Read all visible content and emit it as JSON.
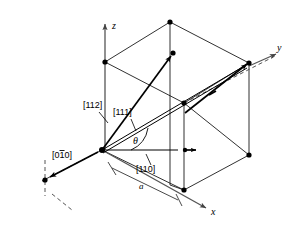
{
  "figure": {
    "axes": {
      "z": "z",
      "y": "y",
      "x": "x"
    },
    "labels": {
      "dir_112": "[112]",
      "dir_111": "[111]",
      "dir_110": "[110]",
      "dir_0bar10_pre": "[0",
      "dir_0bar10_bar": "1",
      "dir_0bar10_post": "0]",
      "dir_0bar10_full": "[010]",
      "angle": "θ",
      "lattice_param": "a"
    },
    "colors": {
      "ink": "#000000",
      "edge": "#1a1a1a",
      "axis": "#555555",
      "background": "#ffffff"
    }
  }
}
